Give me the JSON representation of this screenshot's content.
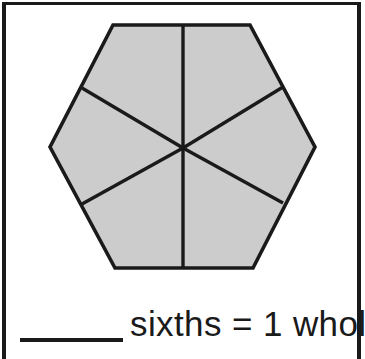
{
  "worksheet": {
    "kind": "fraction-shape-worksheet",
    "background_color": "#ffffff",
    "frame_color": "#1a1a1a"
  },
  "figure": {
    "shape_name": "hexagon",
    "parts_total": 6,
    "parts_shaded": 6,
    "fill_color": "#cccccc",
    "stroke_color": "#1a1a1a",
    "center": [
      177,
      142
    ],
    "vertices": [
      [
        107,
        19
      ],
      [
        244,
        19
      ],
      [
        309,
        141
      ],
      [
        247,
        262
      ],
      [
        109,
        262
      ],
      [
        44,
        141
      ]
    ],
    "divider_endpoints": [
      [
        177,
        19
      ],
      [
        277,
        81
      ],
      [
        277,
        197
      ],
      [
        177,
        262
      ],
      [
        76,
        198
      ],
      [
        76,
        82
      ]
    ]
  },
  "answer": {
    "blank_label": "blank-answer-line",
    "sentence": "sixths = 1 whole",
    "unit_word": "sixths",
    "equals_sign": "=",
    "whole_value": "1",
    "whole_word": "whole"
  }
}
